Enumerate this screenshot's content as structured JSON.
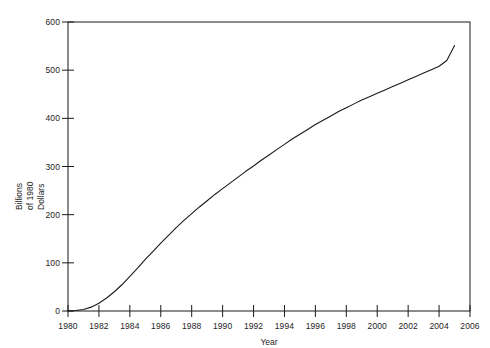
{
  "chart_data": {
    "type": "line",
    "title": "",
    "subtitle": "",
    "xlabel": "Year",
    "ylabel": "Billions of 1980 Dollars",
    "ylabel_lines": [
      "Billions",
      "of 1980",
      "Dollars"
    ],
    "xlim": [
      1980,
      2006
    ],
    "ylim": [
      0,
      600
    ],
    "xticks": [
      1980,
      1982,
      1984,
      1986,
      1988,
      1990,
      1992,
      1994,
      1996,
      1998,
      2000,
      2002,
      2004,
      2006
    ],
    "yticks": [
      0,
      100,
      200,
      300,
      400,
      500,
      600
    ],
    "xtick_labels": [
      "1980",
      "1982",
      "1984",
      "1986",
      "1988",
      "1990",
      "1992",
      "1994",
      "1996",
      "1998",
      "2000",
      "2002",
      "2004",
      "2006"
    ],
    "ytick_labels": [
      "0",
      "100",
      "200",
      "300",
      "400",
      "500",
      "600"
    ],
    "grid": false,
    "legend": false,
    "legend_position": "none",
    "line_color": "#1a1a1a",
    "line_width": 1.1,
    "series": [
      {
        "name": "Cumulative value",
        "x": [
          1980,
          1980.5,
          1981,
          1981.5,
          1982,
          1982.5,
          1983,
          1983.5,
          1984,
          1984.5,
          1985,
          1985.5,
          1986,
          1986.5,
          1987,
          1987.5,
          1988,
          1988.5,
          1989,
          1989.5,
          1990,
          1990.5,
          1991,
          1991.5,
          1992,
          1992.5,
          1993,
          1993.5,
          1994,
          1994.5,
          1995,
          1995.5,
          1996,
          1996.5,
          1997,
          1997.5,
          1998,
          1998.5,
          1999,
          1999.5,
          2000,
          2000.5,
          2001,
          2001.5,
          2002,
          2002.5,
          2003,
          2003.5,
          2004,
          2004.5,
          2005
        ],
        "y": [
          0,
          1,
          3,
          8,
          16,
          27,
          40,
          55,
          72,
          89,
          107,
          124,
          141,
          157,
          173,
          188,
          202,
          216,
          229,
          242,
          254,
          266,
          278,
          290,
          301,
          313,
          324,
          335,
          346,
          357,
          367,
          377,
          387,
          396,
          405,
          414,
          422,
          430,
          438,
          445,
          452,
          459,
          466,
          473,
          480,
          487,
          494,
          501,
          508,
          520,
          551
        ]
      }
    ]
  },
  "axes": {
    "x_title": "Year",
    "y_title_lines": [
      "Billions",
      "of 1980",
      "Dollars"
    ]
  }
}
